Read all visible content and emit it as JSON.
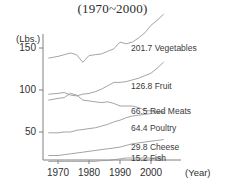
{
  "chart_data": {
    "type": "line",
    "title": "(1970~2000)",
    "xlabel": "(Year)",
    "ylabel": "(Lbs.)",
    "xlim": [
      1966,
      2004
    ],
    "ylim": [
      0,
      165
    ],
    "grid": false,
    "legend_position": "right-inline",
    "x_ticks": [
      "1970",
      "1980",
      "1990",
      "2000"
    ],
    "x_tick_values": [
      1970,
      1980,
      1990,
      2000
    ],
    "y_ticks": [
      "50",
      "100",
      "150"
    ],
    "y_tick_values": [
      50,
      100,
      150
    ],
    "x": [
      1967,
      1970,
      1972,
      1974,
      1976,
      1978,
      1980,
      1982,
      1984,
      1986,
      1988,
      1990,
      1992,
      1994,
      1996,
      1998,
      2000,
      2002,
      2004
    ],
    "series": [
      {
        "name": "Vegetables",
        "end_label": "201.7 Vegetables",
        "end_value": 201.7,
        "values": [
          138,
          140,
          142,
          144,
          142,
          133,
          141,
          142,
          143,
          146,
          149,
          157,
          155,
          157,
          162,
          168,
          177,
          183,
          190
        ]
      },
      {
        "name": "Fruit",
        "end_label": "126.8 Fruit",
        "end_value": 126.8,
        "values": [
          95,
          96,
          97,
          94,
          93,
          95,
          96,
          98,
          101,
          105,
          109,
          109,
          110,
          112,
          114,
          117,
          120,
          126,
          133
        ]
      },
      {
        "name": "Red Meats",
        "end_label": "66.5 Red Meats",
        "end_value": 66.5,
        "values": [
          88,
          90,
          91,
          96,
          94,
          88,
          87,
          86,
          85,
          86,
          84,
          81,
          81,
          81,
          79,
          76,
          75,
          74,
          74
        ]
      },
      {
        "name": "Poultry",
        "end_label": "64.4 Poultry",
        "end_value": 64.4,
        "values": [
          49,
          49,
          50,
          50,
          52,
          53,
          54,
          55,
          57,
          59,
          62,
          64,
          67,
          69,
          70,
          71,
          72,
          73,
          74
        ]
      },
      {
        "name": "Cheese",
        "end_label": "29.8 Cheese",
        "end_value": 29.8,
        "values": [
          22,
          22,
          23,
          24,
          25,
          26,
          27,
          28,
          29,
          30,
          31,
          32,
          34,
          36,
          37,
          38,
          39,
          40,
          41
        ]
      },
      {
        "name": "Fish",
        "end_label": "15.2 Fish",
        "end_value": 15.2,
        "values": [
          15,
          15,
          15,
          15,
          15,
          15,
          15,
          15,
          16,
          16,
          17,
          18,
          19,
          19,
          19,
          19,
          19,
          19,
          19
        ]
      }
    ],
    "colors": {
      "line": "#9a9a9a",
      "axis": "#808080",
      "text": "#303030"
    }
  }
}
